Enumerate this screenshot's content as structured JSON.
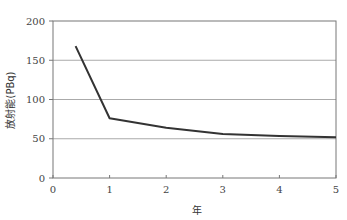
{
  "chart_data": {
    "type": "line",
    "title": "",
    "xlabel": "年",
    "ylabel": "放射能(PBq)",
    "xlim": [
      0,
      5
    ],
    "ylim": [
      0,
      200
    ],
    "xticks": [
      0,
      1,
      2,
      3,
      4,
      5
    ],
    "yticks": [
      0,
      50,
      100,
      150,
      200
    ],
    "grid": "horizontal",
    "legend": null,
    "series": [
      {
        "name": "放射能",
        "color": "#333333",
        "x": [
          0.4,
          1,
          2,
          3,
          4,
          5
        ],
        "y": [
          168,
          76,
          64,
          56,
          53.5,
          52
        ]
      }
    ]
  },
  "colors": {
    "line": "#333333",
    "axis": "#777777",
    "grid": "#aaaaaa"
  }
}
